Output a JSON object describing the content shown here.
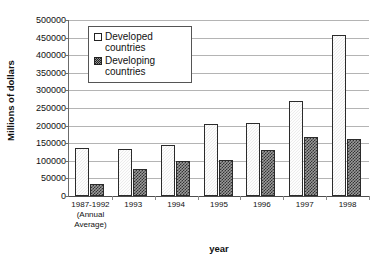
{
  "chart_data": {
    "type": "bar",
    "title": "",
    "subtitle": "",
    "xlabel": "year",
    "ylabel": "Millions of dollars",
    "ylim": [
      0,
      500000
    ],
    "ytick_step": 50000,
    "yticks": [
      "500000",
      "450000",
      "400000",
      "350000",
      "300000",
      "250000",
      "200000",
      "150000",
      "100000",
      "50000",
      "0"
    ],
    "grid": true,
    "legend_position": "top-left-inside",
    "categories": [
      "1987-1992 (Annual Average)",
      "1993",
      "1994",
      "1995",
      "1996",
      "1997",
      "1998"
    ],
    "category_labels": [
      {
        "line1": "1987-1992",
        "line2": "(Annual",
        "line3": "Average)"
      },
      {
        "line1": "1993",
        "line2": "",
        "line3": ""
      },
      {
        "line1": "1994",
        "line2": "",
        "line3": ""
      },
      {
        "line1": "1995",
        "line2": "",
        "line3": ""
      },
      {
        "line1": "1996",
        "line2": "",
        "line3": ""
      },
      {
        "line1": "1997",
        "line2": "",
        "line3": ""
      },
      {
        "line1": "1998",
        "line2": "",
        "line3": ""
      }
    ],
    "series": [
      {
        "name": "Developed countries",
        "pattern": "light-solid",
        "color": "#ececec",
        "values": [
          137000,
          133000,
          145000,
          205000,
          208000,
          270000,
          457000
        ]
      },
      {
        "name": "Developing countries",
        "pattern": "checkerboard",
        "color": "#9a9a9a",
        "values": [
          35000,
          77000,
          99000,
          103000,
          132000,
          169000,
          162000
        ]
      }
    ]
  },
  "legend": {
    "entries": [
      {
        "label_line1": "Developed",
        "label_line2": "countries"
      },
      {
        "label_line1": "Developing",
        "label_line2": "countries"
      }
    ]
  },
  "axes": {
    "y_title": "Millions of dollars",
    "x_title": "year"
  },
  "colors": {
    "developed_fill": "#ececec",
    "developing_fill": "#9a9a9a",
    "bar_border": "#2b2b2b",
    "gridline": "#b4b4b4",
    "axis": "#6b6b6b",
    "text": "#111111",
    "background": "#ffffff"
  }
}
